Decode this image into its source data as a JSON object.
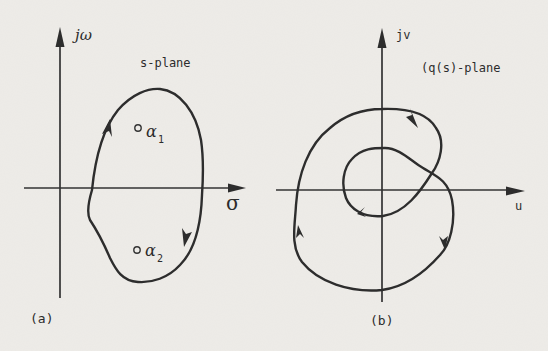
{
  "figure": {
    "panels": [
      {
        "id": "a",
        "caption": "(a)",
        "plane_label": "s-plane",
        "vertical_axis_label": "jω",
        "horizontal_axis_label": "σ",
        "points": [
          {
            "symbol": "α",
            "subscript": "1"
          },
          {
            "symbol": "α",
            "subscript": "2"
          }
        ],
        "contour_direction": "clockwise"
      },
      {
        "id": "b",
        "caption": "(b)",
        "plane_label": "(q(s)-plane",
        "vertical_axis_label": "jv",
        "horizontal_axis_label": "u",
        "contour_direction": "clockwise",
        "encirclements_of_origin": 2
      }
    ],
    "colors": {
      "ink": "#2d2d2d",
      "paper": "#eeece8"
    }
  }
}
